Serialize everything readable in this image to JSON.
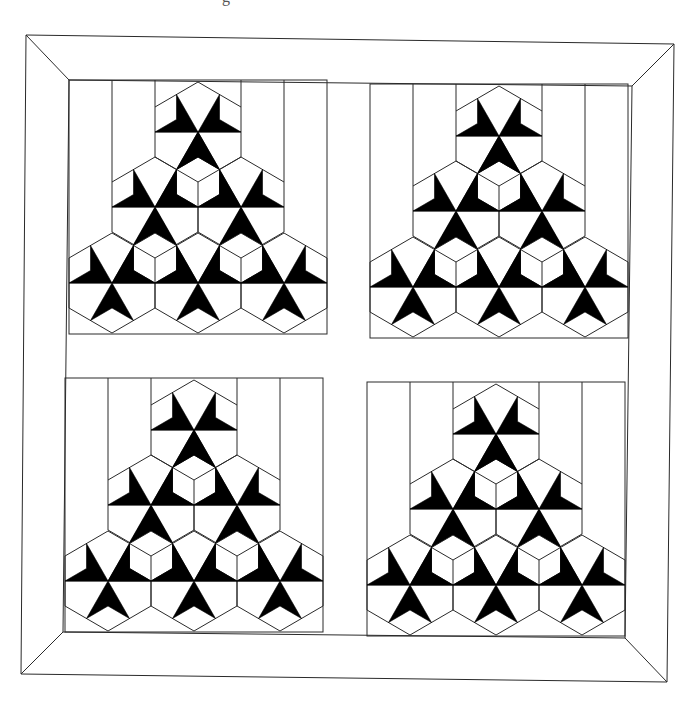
{
  "page": {
    "caption_fragment": "g",
    "background": "#ffffff",
    "ink_color": "#000000",
    "line_color": "#2a2a2a"
  },
  "quilt": {
    "description": "Four-block quilt layout with wide mitered border; each block shows a triangular arrangement of six tri-dart stars and three tumbling-block cubes",
    "border": {
      "outer": [
        [
          26,
          35
        ],
        [
          674,
          44
        ],
        [
          667,
          682
        ],
        [
          21,
          674
        ]
      ],
      "inner": [
        [
          69,
          80
        ],
        [
          632,
          86
        ],
        [
          625,
          638
        ],
        [
          63,
          632
        ]
      ]
    },
    "block_template": {
      "frame": [
        69,
        80,
        327,
        334
      ],
      "strip_lines_x": [
        112,
        155,
        241,
        284
      ],
      "star_centers": [
        [
          198,
          132
        ],
        [
          155,
          207
        ],
        [
          241,
          207
        ],
        [
          112,
          283
        ],
        [
          198,
          283
        ],
        [
          284,
          283
        ]
      ],
      "cube_centers": [
        [
          198,
          182
        ],
        [
          155,
          258
        ],
        [
          241,
          258
        ]
      ],
      "row_lines": [
        [
          155,
          241,
          132
        ],
        [
          112,
          284,
          207
        ],
        [
          69,
          327,
          283
        ]
      ],
      "hex_half_width": 43,
      "hex_half_height": 50
    },
    "blocks": [
      {
        "name": "block-top-left",
        "dx": 0,
        "dy": 0
      },
      {
        "name": "block-top-right",
        "dx": 301,
        "dy": 4
      },
      {
        "name": "block-bottom-left",
        "dx": -4,
        "dy": 298
      },
      {
        "name": "block-bottom-right",
        "dx": 298,
        "dy": 302
      }
    ]
  }
}
